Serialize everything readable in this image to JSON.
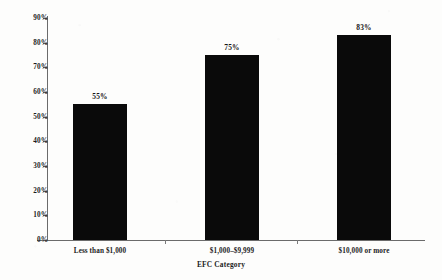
{
  "chart_data": {
    "type": "bar",
    "title": "",
    "subtitle": "",
    "categories": [
      "Less than $1,000",
      "$1,000–$9,999",
      "$10,000 or more"
    ],
    "values": [
      55,
      75,
      83
    ],
    "data_labels": [
      "55%",
      "75%",
      "83%"
    ],
    "xlabel": "EFC Category",
    "ylabel": "",
    "ylim": [
      0,
      90
    ],
    "ytick_values": [
      0,
      10,
      20,
      30,
      40,
      50,
      60,
      70,
      80,
      90
    ],
    "ytick_labels": [
      "0%",
      "10%",
      "20%",
      "30%",
      "40%",
      "50%",
      "60%",
      "70%",
      "80%",
      "90%"
    ],
    "grid": false,
    "legend": false,
    "legend_position": "none",
    "bar_color": "#0a0a0a",
    "axis_color": "#6b6b6b",
    "text_color": "#1c1c1c",
    "background_color": "#ffffff"
  }
}
